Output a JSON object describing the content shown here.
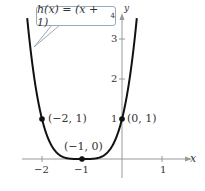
{
  "chart_data": {
    "type": "line",
    "function": "h(x) = (x + 1)^4",
    "xlabel": "x",
    "ylabel": "y",
    "xlim": [
      -2.5,
      1.5
    ],
    "ylim": [
      -0.3,
      3.6
    ],
    "x_ticks": [
      "-2",
      "-1",
      "1"
    ],
    "y_ticks": [
      "1",
      "2",
      "3"
    ],
    "grid": false,
    "points": [
      {
        "label": "(-2, 1)",
        "x": -2,
        "y": 1
      },
      {
        "label": "(-1, 0)",
        "x": -1,
        "y": 0
      },
      {
        "label": "(0, 1)",
        "x": 0,
        "y": 1
      }
    ],
    "series": [
      {
        "name": "h(x)",
        "x": [
          -2.37,
          -2,
          -1.5,
          -1,
          -0.5,
          0,
          0.37
        ],
        "values": [
          3.52,
          1,
          0.0625,
          0,
          0.0625,
          1,
          3.52
        ]
      }
    ]
  },
  "labels": {
    "callout_main": "h(x) = (x + 1)",
    "callout_exp": "4",
    "x_axis": "x",
    "y_axis": "y",
    "tick_x_m2": "−2",
    "tick_x_m1": "−1",
    "tick_x_1": "1",
    "tick_y_1": "1",
    "tick_y_2": "2",
    "tick_y_3": "3",
    "pt_m2": "(−2, 1)",
    "pt_m1": "(−1, 0)",
    "pt_0": "(0, 1)"
  }
}
